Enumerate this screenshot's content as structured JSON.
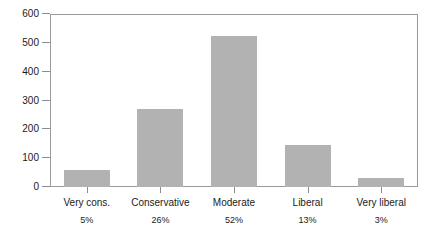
{
  "chart_data": {
    "type": "bar",
    "title": "",
    "subtitle": "",
    "xlabel": "",
    "ylabel": "",
    "categories": [
      "Very cons.",
      "Conservative",
      "Moderate",
      "Liberal",
      "Very liberal"
    ],
    "values": [
      60,
      272,
      523,
      145,
      30
    ],
    "percent_labels": [
      "5%",
      "26%",
      "52%",
      "13%",
      "3%"
    ],
    "ylim": [
      0,
      600
    ],
    "y_ticks": [
      0,
      100,
      200,
      300,
      400,
      500,
      600
    ],
    "y_tick_labels": [
      "0",
      "100",
      "200",
      "300",
      "400",
      "500",
      "600"
    ],
    "grid": false,
    "legend": "none",
    "series": [
      {
        "name": "Count",
        "values": [
          60,
          272,
          523,
          145,
          30
        ]
      }
    ]
  },
  "style": {
    "bar_color": "#b2b2b2",
    "frame_color": "#9a9a9a",
    "tick_color": "#8d8d8d",
    "background": "#ffffff",
    "text_color": "#1a1a1a"
  }
}
